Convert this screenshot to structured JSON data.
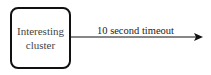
{
  "diagram": {
    "node": {
      "label": "Interesting cluster"
    },
    "edge": {
      "label": "10 second timeout",
      "color": "#111111"
    }
  }
}
